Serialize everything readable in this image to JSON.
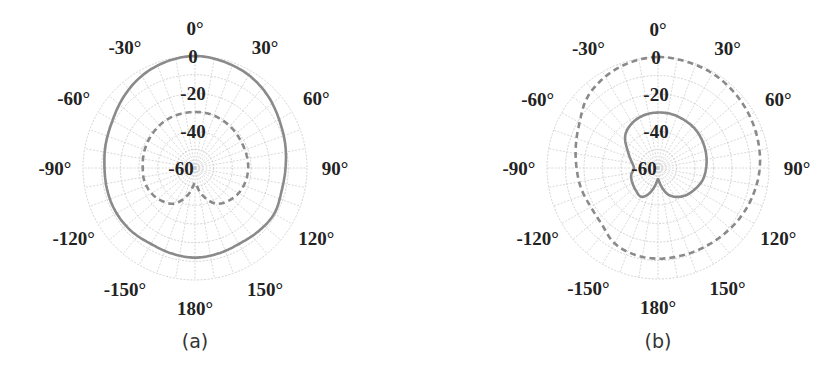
{
  "chart_data": [
    {
      "type": "polar",
      "panel": "(a)",
      "caption": "(a)",
      "center_px": [
        195,
        168
      ],
      "outer_radius_px": 112,
      "radial_range_db": [
        -60,
        0
      ],
      "radial_tick_labels": [
        "0",
        "-20",
        "-40",
        "-60"
      ],
      "radial_ticks": [
        0,
        -20,
        -40,
        -60
      ],
      "angle_tick_labels": [
        "0°",
        "30°",
        "60°",
        "90°",
        "120°",
        "150°",
        "180°",
        "-150°",
        "-120°",
        "-90°",
        "-60°",
        "-30°"
      ],
      "angle_ticks": [
        0,
        30,
        60,
        90,
        120,
        150,
        180,
        -150,
        -120,
        -90,
        -60,
        -30
      ],
      "grid": {
        "ring_step_db": 10,
        "spoke_step_deg": 10
      },
      "series": [
        {
          "name": "solid",
          "style": "solid",
          "color": "#8a8a8a",
          "angles": [
            0,
            15,
            30,
            45,
            60,
            75,
            90,
            105,
            120,
            135,
            150,
            165,
            180,
            -165,
            -150,
            -135,
            -120,
            -105,
            -90,
            -75,
            -60,
            -45,
            -30,
            -15
          ],
          "values_db": [
            0,
            -1,
            -2.5,
            -5,
            -8,
            -10,
            -11.5,
            -12,
            -11,
            -12,
            -13,
            -12.5,
            -12,
            -12.5,
            -13,
            -12,
            -11.5,
            -11.5,
            -11.5,
            -10.5,
            -9,
            -6,
            -3,
            -1
          ]
        },
        {
          "name": "dashed",
          "style": "dashed",
          "color": "#8a8a8a",
          "angles": [
            0,
            15,
            30,
            45,
            60,
            75,
            90,
            105,
            120,
            135,
            150,
            165,
            180,
            -165,
            -150,
            -135,
            -120,
            -105,
            -90,
            -75,
            -60,
            -45,
            -30,
            -15
          ],
          "values_db": [
            -30,
            -30,
            -30.5,
            -31,
            -31.5,
            -31.5,
            -31.5,
            -32,
            -33,
            -35,
            -38,
            -45,
            -52,
            -45,
            -38,
            -35,
            -33,
            -32,
            -32,
            -31.5,
            -31,
            -30.5,
            -30,
            -30
          ]
        }
      ]
    },
    {
      "type": "polar",
      "panel": "(b)",
      "caption": "(b)",
      "center_px": [
        658,
        168
      ],
      "outer_radius_px": 111,
      "radial_range_db": [
        -60,
        0
      ],
      "radial_tick_labels": [
        "0",
        "-20",
        "-40",
        "-60"
      ],
      "radial_ticks": [
        0,
        -20,
        -40,
        -60
      ],
      "angle_tick_labels": [
        "0°",
        "30°",
        "60°",
        "90°",
        "120°",
        "150°",
        "180°",
        "-150°",
        "-120°",
        "-90°",
        "-60°",
        "-30°"
      ],
      "angle_ticks": [
        0,
        30,
        60,
        90,
        120,
        150,
        180,
        -150,
        -120,
        -90,
        -60,
        -30
      ],
      "grid": {
        "ring_step_db": 10,
        "spoke_step_deg": 10
      },
      "series": [
        {
          "name": "solid",
          "style": "solid",
          "color": "#8a8a8a",
          "angles": [
            0,
            15,
            30,
            45,
            60,
            75,
            90,
            105,
            120,
            135,
            150,
            160,
            170,
            180,
            -170,
            -160,
            -150,
            -135,
            -120,
            -105,
            -90,
            -75,
            -60,
            -45,
            -30,
            -15
          ],
          "values_db": [
            -30,
            -30,
            -30.5,
            -31,
            -32,
            -33,
            -34,
            -35,
            -37,
            -39,
            -42,
            -45,
            -50,
            -54,
            -50,
            -45,
            -42,
            -43,
            -44,
            -45,
            -47,
            -45,
            -41,
            -35,
            -32,
            -30.5
          ]
        },
        {
          "name": "dashed",
          "style": "dashed",
          "color": "#8a8a8a",
          "angles": [
            0,
            15,
            30,
            45,
            60,
            75,
            90,
            105,
            120,
            135,
            150,
            165,
            180,
            -165,
            -150,
            -135,
            -120,
            -105,
            -90,
            -75,
            -60,
            -45,
            -30,
            -15
          ],
          "values_db": [
            0,
            -0.5,
            -1,
            -2,
            -3,
            -4,
            -5,
            -6.5,
            -8,
            -9.5,
            -10.5,
            -11,
            -11,
            -11.5,
            -13,
            -17,
            -18,
            -17,
            -16,
            -14,
            -11,
            -6,
            -3,
            -1
          ]
        }
      ]
    }
  ]
}
